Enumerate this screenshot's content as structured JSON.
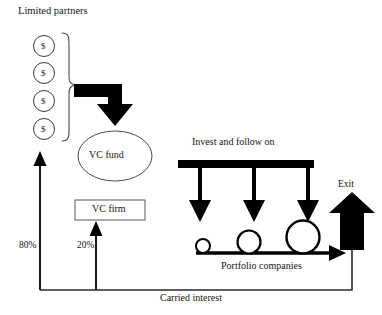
{
  "diagram": {
    "colors": {
      "ink": "#111111",
      "thin_stroke": "#3a3a3a",
      "thick_fill": "#000000",
      "background": "#ffffff"
    },
    "labels": {
      "limited_partners": "Limited partners",
      "vc_fund": "VC fund",
      "vc_firm": "VC firm",
      "invest_follow_on": "Invest and follow on",
      "exit": "Exit",
      "portfolio_companies": "Portfolio companies",
      "carried_interest": "Carried interest",
      "lp_share": "80%",
      "firm_share": "20%"
    },
    "lp_tokens": [
      {
        "symbol": "$"
      },
      {
        "symbol": "$"
      },
      {
        "symbol": "$"
      },
      {
        "symbol": "$"
      }
    ],
    "portfolio_companies": [
      {
        "size": "small"
      },
      {
        "size": "medium"
      },
      {
        "size": "large"
      }
    ],
    "invest_arrow_count": 3
  }
}
